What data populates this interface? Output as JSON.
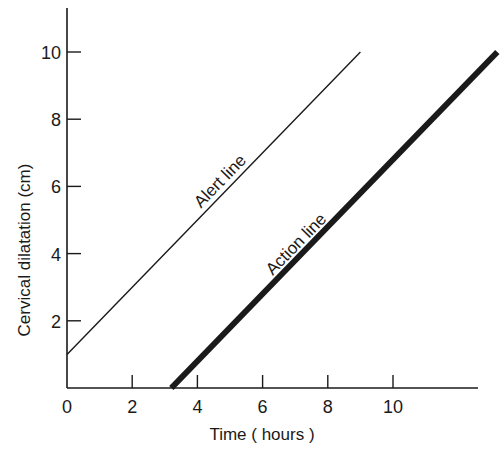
{
  "chart_data": {
    "type": "line",
    "title": "",
    "xlabel": "Time ( hours )",
    "ylabel": "Cervical dilatation (cm)",
    "xlim": [
      0,
      13.2
    ],
    "ylim": [
      0,
      11
    ],
    "x_ticks": [
      0,
      2,
      4,
      6,
      8,
      10
    ],
    "y_ticks": [
      2,
      4,
      6,
      8,
      10
    ],
    "x_tick_labels": [
      "0",
      "2",
      "4",
      "6",
      "8",
      "10"
    ],
    "y_tick_labels": [
      "2",
      "4",
      "6",
      "8",
      "10"
    ],
    "grid": false,
    "legend": null,
    "series": [
      {
        "name": "Alert line",
        "style": "thin",
        "color": "#1a1a1a",
        "x": [
          0,
          9
        ],
        "y": [
          1,
          10
        ]
      },
      {
        "name": "Action line",
        "style": "thick",
        "color": "#1a1a1a",
        "x": [
          3.2,
          13.2
        ],
        "y": [
          0,
          10
        ]
      }
    ],
    "annotations": [
      {
        "text": "Alert line",
        "along_series": "Alert line"
      },
      {
        "text": "Action line",
        "along_series": "Action line"
      }
    ]
  }
}
